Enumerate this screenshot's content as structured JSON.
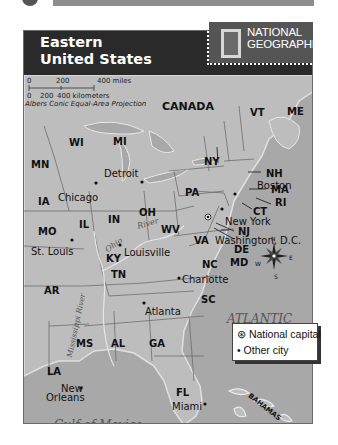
{
  "header": {
    "title_line1": "Eastern",
    "title_line2": "United States",
    "logo_line1": "NATIONAL",
    "logo_line2": "GEOGRAPHIC"
  },
  "scale": {
    "miles_0": "0",
    "miles_200": "200",
    "miles_400": "400 miles",
    "km_0": "0",
    "km_200": "200",
    "km_400": "400 kilometers",
    "projection": "Albers Conic Equal-Area Projection"
  },
  "regions": {
    "canada": "CANADA",
    "atlantic_1": "ATLANTIC",
    "atlantic_2": "OCEAN",
    "gulf": "Gulf of Mexico",
    "bahamas": "BAHAMAS"
  },
  "states": {
    "MN": "MN",
    "WI": "WI",
    "MI": "MI",
    "IA": "IA",
    "IL": "IL",
    "IN": "IN",
    "OH": "OH",
    "MO": "MO",
    "KY": "KY",
    "WV": "WV",
    "PA": "PA",
    "NY": "NY",
    "VT": "VT",
    "ME": "ME",
    "NH": "NH",
    "MA": "MA",
    "RI": "RI",
    "CT": "CT",
    "NJ": "NJ",
    "DE": "DE",
    "MD": "MD",
    "VA": "VA",
    "NC": "NC",
    "TN": "TN",
    "SC": "SC",
    "AR": "AR",
    "MS": "MS",
    "AL": "AL",
    "GA": "GA",
    "LA": "LA",
    "FL": "FL"
  },
  "cities": {
    "detroit": "Detroit",
    "chicago": "Chicago",
    "st_louis": "St. Louis",
    "louisville": "Louisville",
    "boston": "Boston",
    "new_york": "New York",
    "washington": "Washington, D.C.",
    "charlotte": "Charlotte",
    "atlanta": "Atlanta",
    "new_orleans_1": "New",
    "new_orleans_2": "Orleans",
    "miami": "Miami"
  },
  "rivers": {
    "ohio_1": "Ohio",
    "ohio_2": "River",
    "mississippi": "Mississippi River"
  },
  "compass": {
    "n": "N",
    "s": "S",
    "e": "E",
    "w": "W"
  },
  "legend": {
    "capital_symbol": "⊛",
    "capital_label": "National capital",
    "city_symbol": "•",
    "city_label": "Other city"
  },
  "colors": {
    "land": "#b9b9b9",
    "water": "#a4a4a4",
    "header": "#2a2a2a",
    "logo_bg": "#555555"
  }
}
